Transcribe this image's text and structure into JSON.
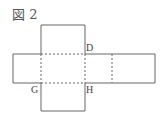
{
  "figure": {
    "title": "図 2",
    "labels": {
      "D": "D",
      "G": "G",
      "H": "H"
    },
    "colors": {
      "line": "#666666",
      "text": "#444444"
    }
  }
}
